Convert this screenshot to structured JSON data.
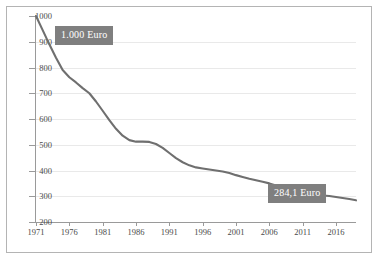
{
  "chart_data": {
    "type": "line",
    "title": "",
    "subtitle": "",
    "xlabel": "",
    "ylabel": "",
    "ylim": [
      200,
      1000
    ],
    "xlim": [
      1971,
      2019
    ],
    "grid": true,
    "legend_position": "none",
    "y_ticks": [
      1000,
      900,
      800,
      700,
      600,
      500,
      400,
      300,
      200
    ],
    "x_ticks": [
      1971,
      1976,
      1981,
      1986,
      1991,
      1996,
      2001,
      2006,
      2011,
      2016
    ],
    "line_color": "#6f6f6f",
    "annotations": [
      {
        "name": "start-value",
        "text": "1.000 Euro",
        "value": 1000,
        "x": 1971
      },
      {
        "name": "end-value",
        "text": "284,1 Euro",
        "value": 284.1,
        "x": 2019
      }
    ],
    "series": [
      {
        "name": "Wert in Euro",
        "x": [
          1971,
          1972,
          1973,
          1974,
          1975,
          1976,
          1977,
          1978,
          1979,
          1980,
          1981,
          1982,
          1983,
          1984,
          1985,
          1986,
          1987,
          1988,
          1989,
          1990,
          1991,
          1992,
          1993,
          1994,
          1995,
          1996,
          1997,
          1998,
          1999,
          2000,
          2001,
          2002,
          2003,
          2004,
          2005,
          2006,
          2007,
          2008,
          2009,
          2010,
          2011,
          2012,
          2013,
          2014,
          2015,
          2016,
          2017,
          2018,
          2019
        ],
        "values": [
          1000,
          945,
          890,
          838,
          790,
          762,
          742,
          720,
          700,
          668,
          632,
          596,
          562,
          535,
          518,
          512,
          512,
          511,
          503,
          488,
          468,
          448,
          432,
          420,
          412,
          408,
          404,
          400,
          396,
          390,
          382,
          375,
          368,
          362,
          356,
          350,
          342,
          334,
          332,
          326,
          319,
          312,
          307,
          303,
          301,
          297,
          293,
          289,
          284.1
        ]
      }
    ]
  }
}
